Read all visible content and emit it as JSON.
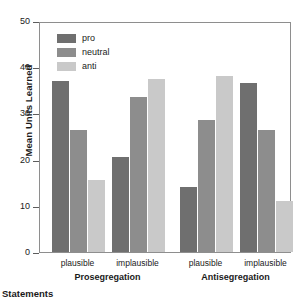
{
  "chart_data": {
    "type": "bar",
    "title": "",
    "xlabel": "Statements",
    "ylabel": "Mean Units Learned",
    "ylim": [
      0,
      50
    ],
    "yticks": [
      0,
      10,
      20,
      30,
      40,
      50
    ],
    "grid": false,
    "legend_position": "top-left",
    "categories": [
      "plausible",
      "implausible",
      "plausible",
      "implausible"
    ],
    "groups": [
      {
        "name": "Prosegregation",
        "subgroups": [
          {
            "label": "plausible",
            "values": {
              "pro": 37.0,
              "neutral": 26.5,
              "anti": 15.5
            }
          },
          {
            "label": "implausible",
            "values": {
              "pro": 20.5,
              "neutral": 33.5,
              "anti": 37.5
            }
          }
        ]
      },
      {
        "name": "Antisegregation",
        "subgroups": [
          {
            "label": "plausible",
            "values": {
              "pro": 14.0,
              "neutral": 28.5,
              "anti": 38.0
            }
          },
          {
            "label": "implausible",
            "values": {
              "pro": 36.5,
              "neutral": 26.5,
              "anti": 11.0
            }
          }
        ]
      }
    ],
    "series": [
      {
        "name": "pro",
        "color": "#6f6f6f",
        "values": [
          37.0,
          20.5,
          14.0,
          36.5
        ]
      },
      {
        "name": "neutral",
        "color": "#8d8d8d",
        "values": [
          26.5,
          33.5,
          28.5,
          26.5
        ]
      },
      {
        "name": "anti",
        "color": "#c9c9c9",
        "values": [
          15.5,
          37.5,
          38.0,
          11.0
        ]
      }
    ]
  },
  "legend": {
    "items": [
      {
        "label": "pro",
        "color": "#6f6f6f"
      },
      {
        "label": "neutral",
        "color": "#8d8d8d"
      },
      {
        "label": "anti",
        "color": "#c9c9c9"
      }
    ]
  },
  "axis": {
    "y_title": "Mean Units Learned",
    "x_title": "Statements",
    "y_tick_labels": [
      "0",
      "10",
      "20",
      "30",
      "40",
      "50"
    ]
  }
}
